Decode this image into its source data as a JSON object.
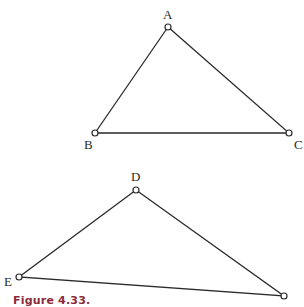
{
  "figure": {
    "caption": "Figure 4.33.",
    "caption_color": "#8b2a3a",
    "triangles": [
      {
        "name": "ABC",
        "vertices": [
          {
            "label": "A",
            "x": 168,
            "y": 27
          },
          {
            "label": "B",
            "x": 95,
            "y": 133
          },
          {
            "label": "C",
            "x": 289,
            "y": 133
          }
        ]
      },
      {
        "name": "DEF",
        "vertices": [
          {
            "label": "D",
            "x": 136,
            "y": 190
          },
          {
            "label": "E",
            "x": 19,
            "y": 277
          },
          {
            "label": "",
            "x": 284,
            "y": 296
          }
        ]
      }
    ]
  }
}
